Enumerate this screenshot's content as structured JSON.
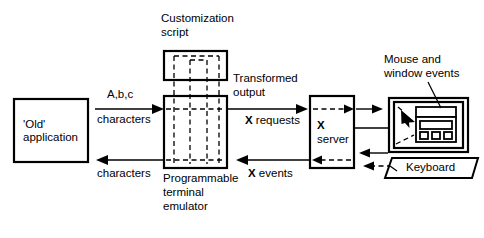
{
  "diagram": {
    "stroke_color": "#000000",
    "background_color": "#ffffff",
    "nodes": {
      "old_application": {
        "label_line1": "'Old'",
        "label_line2": "application"
      },
      "customization_script": {
        "label_line1": "Customization",
        "label_line2": "script"
      },
      "terminal_emulator": {
        "label_line1": "Programmable",
        "label_line2": "terminal",
        "label_line3": "emulator"
      },
      "x_server": {
        "label_line1": "X",
        "label_line2": "server"
      },
      "keyboard": {
        "label": "Keyboard"
      },
      "mouse_window_events": {
        "label_line1": "Mouse and",
        "label_line2": "window events"
      }
    },
    "edges": {
      "app_to_pte_top": {
        "label_line1": "A,b,c",
        "label_line2": "characters"
      },
      "pte_to_app_bottom": {
        "label": "characters"
      },
      "pte_to_xserver_top": {
        "label_line1": "Transformed",
        "label_line2": "output",
        "label_line3_bold": "X",
        "label_line3_rest": " requests"
      },
      "xserver_to_pte_bottom": {
        "label_bold": "X",
        "label_rest": " events"
      }
    }
  }
}
